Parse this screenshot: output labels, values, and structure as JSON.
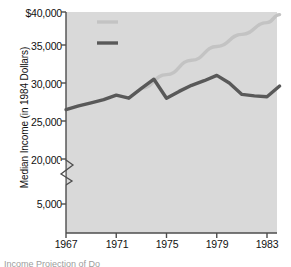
{
  "chart_data": {
    "type": "line",
    "title": "",
    "xlabel": "",
    "ylabel": "Median Income (in 1984 Dollars)",
    "xlim": [
      1966,
      1985
    ],
    "ylim": [
      0,
      40000
    ],
    "y_axis_break": {
      "present": true,
      "between": [
        5000,
        20000
      ],
      "note": "broken y-axis between the 5,000 and 20,000 ticks"
    },
    "grid": false,
    "legend_position": "upper-left-inside",
    "x_tick_labels": [
      "1967",
      "1971",
      "1975",
      "1979",
      "1983"
    ],
    "x_tick_values": [
      1967,
      1971,
      1975,
      1979,
      1983
    ],
    "y_tick_labels": [
      "$40,000",
      "35,000",
      "30,000",
      "25,000",
      "20,000",
      "5,000"
    ],
    "y_tick_values": [
      40000,
      35000,
      30000,
      25000,
      20000,
      5000
    ],
    "series": [
      {
        "name": "Annual Income",
        "color": "#595959",
        "style": "solid-thick",
        "x": [
          1967,
          1968,
          1969,
          1970,
          1971,
          1972,
          1973,
          1974,
          1975,
          1976,
          1977,
          1978,
          1979,
          1980,
          1981,
          1982,
          1983,
          1984
        ],
        "values": [
          26500,
          27000,
          27400,
          27800,
          28400,
          28000,
          29300,
          30500,
          28000,
          28900,
          29700,
          30300,
          31000,
          30000,
          28500,
          28300,
          28200,
          29600
        ]
      },
      {
        "name": "Projected Income",
        "color": "#c3c3c3",
        "style": "solid-thick",
        "x": [
          1973,
          1975,
          1977,
          1979,
          1981,
          1983,
          1984
        ],
        "values": [
          29300,
          31100,
          33000,
          34800,
          36600,
          38400,
          39600
        ]
      }
    ],
    "legend": [
      {
        "label": "Projected Income",
        "color": "#c3c3c3"
      },
      {
        "label": "Annual Income",
        "color": "#595959"
      }
    ],
    "plot_background": "#d9d9d9",
    "axis_color": "#4d4d4d"
  },
  "footnote": {
    "text": "Income Projection of Do"
  }
}
